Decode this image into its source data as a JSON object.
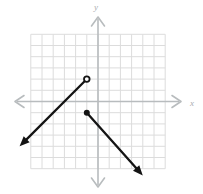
{
  "figure": {
    "type": "coordinate-plane",
    "x_axis_label": "x",
    "y_axis_label": "y",
    "grid": {
      "x_min": -6,
      "x_max": 6,
      "y_min": -6,
      "y_max": 6
    },
    "rays": [
      {
        "name": "upper-ray",
        "endpoint": {
          "x": -1,
          "y": 2
        },
        "endpoint_style": "open",
        "arrow_end": {
          "x": -7,
          "y": -4
        },
        "direction": "down-left"
      },
      {
        "name": "lower-ray",
        "endpoint": {
          "x": -1,
          "y": -1
        },
        "endpoint_style": "closed",
        "arrow_end": {
          "x": 4,
          "y": -6.6
        },
        "direction": "down-right"
      }
    ],
    "colors": {
      "background": "#ffffff",
      "grid_line": "#dcdcdc",
      "axis_line": "#b8bcbe",
      "axis_label": "#a9adb0",
      "ray": "#141414"
    }
  }
}
